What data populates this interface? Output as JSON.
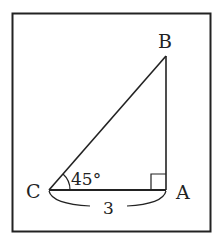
{
  "diagram": {
    "type": "right-triangle",
    "vertices": [
      {
        "name": "B",
        "label": "B"
      },
      {
        "name": "C",
        "label": "C"
      },
      {
        "name": "A",
        "label": "A"
      }
    ],
    "angle_label": "45°",
    "angle_at": "C",
    "right_angle_at": "A",
    "side_label": "3",
    "side": "CA",
    "colors": {
      "stroke": "#222222",
      "background": "#ffffff"
    }
  }
}
